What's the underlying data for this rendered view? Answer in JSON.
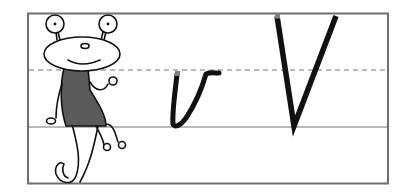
{
  "worksheet": {
    "title": "Letter V handwriting practice",
    "lowercase_letter": "v",
    "uppercase_letter": "V",
    "colors": {
      "frame": "#6e6e6e",
      "guide_line": "#777777",
      "ink": "#111111",
      "start_dot": "#808080",
      "character_fill": "#5a5a5a"
    }
  }
}
